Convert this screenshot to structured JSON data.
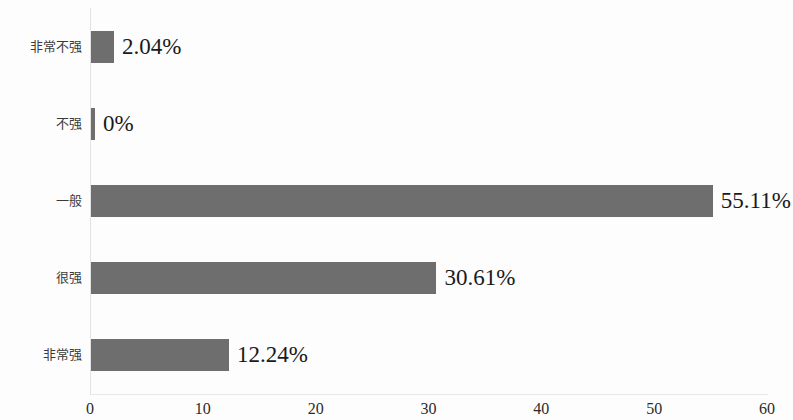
{
  "chart_data": {
    "type": "bar",
    "orientation": "horizontal",
    "title": "",
    "subtitle": "",
    "xlabel": "",
    "ylabel": "",
    "categories": [
      "非常不强",
      "不强",
      "一般",
      "很强",
      "非常强"
    ],
    "values": [
      2.04,
      0,
      55.11,
      30.61,
      12.24
    ],
    "data_labels": [
      "2.04%",
      "0%",
      "55.11%",
      "30.61%",
      "12.24%"
    ],
    "xlim": [
      0,
      60
    ],
    "xticks": [
      0,
      10,
      20,
      30,
      40,
      50,
      60
    ],
    "xtick_labels": [
      "0",
      "10",
      "20",
      "30",
      "40",
      "50",
      "60"
    ],
    "grid": false,
    "legend": false,
    "legend_position": "none",
    "bar_color": "#6e6e6e",
    "axis_color": "#e2e2e2",
    "label_color": "#3a3a3a",
    "value_color": "#1a1a1a",
    "background_color": "#fdfdfd"
  }
}
